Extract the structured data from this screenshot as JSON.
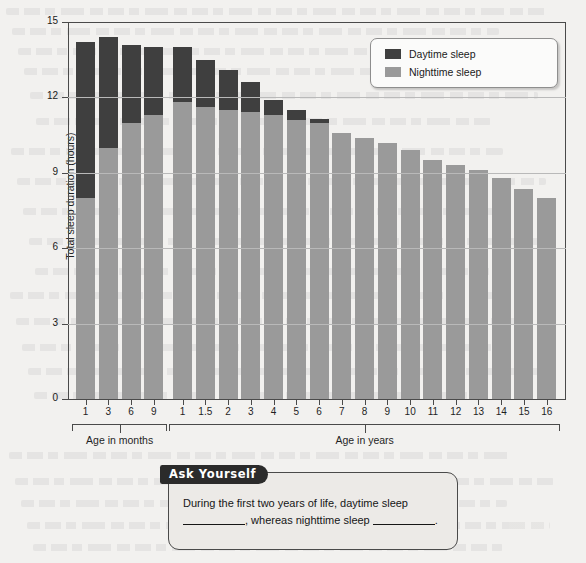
{
  "chart_data": {
    "type": "bar",
    "title": "",
    "subtitle": "",
    "stacked": true,
    "xlabel": "",
    "ylabel": "Total sleep duration (hours)",
    "ylim": [
      0,
      15
    ],
    "yticks": [
      0,
      3,
      6,
      9,
      12,
      15
    ],
    "grid": true,
    "legend_position": "top-right",
    "categories": [
      "1",
      "3",
      "6",
      "9",
      "1",
      "1.5",
      "2",
      "3",
      "4",
      "5",
      "6",
      "7",
      "8",
      "9",
      "10",
      "11",
      "12",
      "13",
      "14",
      "15",
      "16"
    ],
    "group_labels": [
      "Age in months",
      "Age in years"
    ],
    "group_spans": [
      [
        0,
        3
      ],
      [
        4,
        20
      ]
    ],
    "series": [
      {
        "name": "Nighttime sleep",
        "color": "#9a9a9a",
        "values": [
          8.0,
          10.0,
          11.0,
          11.3,
          11.8,
          11.6,
          11.5,
          11.4,
          11.3,
          11.1,
          11.0,
          10.6,
          10.4,
          10.2,
          9.9,
          9.5,
          9.3,
          9.1,
          8.8,
          8.35,
          8.0
        ]
      },
      {
        "name": "Daytime sleep",
        "color": "#3f3f3f",
        "values": [
          6.2,
          4.4,
          3.1,
          2.7,
          2.2,
          1.9,
          1.6,
          1.2,
          0.6,
          0.4,
          0.15,
          0.0,
          0.0,
          0.0,
          0.0,
          0.0,
          0.0,
          0.0,
          0.0,
          0.0,
          0.0
        ]
      }
    ],
    "totals": [
      14.2,
      14.4,
      14.1,
      14.0,
      14.0,
      13.5,
      13.1,
      12.6,
      11.9,
      11.5,
      11.15,
      10.6,
      10.4,
      10.2,
      9.9,
      9.5,
      9.3,
      9.1,
      8.8,
      8.35,
      8.0
    ]
  },
  "legend": {
    "items": [
      {
        "label": "Daytime sleep",
        "color": "#3f3f3f"
      },
      {
        "label": "Nighttime sleep",
        "color": "#9a9a9a"
      }
    ]
  },
  "ask_yourself": {
    "tab_label": "Ask Yourself",
    "text_part1": "During the first two years of life, daytime sleep",
    "text_part2": ", whereas nighttime sleep",
    "text_part3": "."
  }
}
